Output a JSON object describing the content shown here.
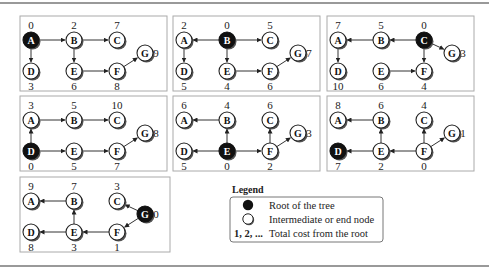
{
  "figure": {
    "panels": [
      {
        "root": "A",
        "nodes": {
          "A": {
            "cost": "0",
            "pos": "tl"
          },
          "B": {
            "cost": "2",
            "pos": "tm"
          },
          "C": {
            "cost": "7",
            "pos": "tr"
          },
          "D": {
            "cost": "3",
            "pos": "bl"
          },
          "E": {
            "cost": "6",
            "pos": "bm"
          },
          "F": {
            "cost": "8",
            "pos": "br"
          },
          "G": {
            "cost": "9",
            "pos": "g"
          }
        },
        "filled": [
          "A"
        ],
        "edges": [
          [
            "A",
            "B"
          ],
          [
            "B",
            "C"
          ],
          [
            "A",
            "D"
          ],
          [
            "B",
            "E"
          ],
          [
            "E",
            "F"
          ],
          [
            "F",
            "G"
          ]
        ]
      },
      {
        "root": "B",
        "nodes": {
          "A": {
            "cost": "2"
          },
          "B": {
            "cost": "0"
          },
          "C": {
            "cost": "5"
          },
          "D": {
            "cost": "5"
          },
          "E": {
            "cost": "4"
          },
          "F": {
            "cost": "6"
          },
          "G": {
            "cost": "7"
          }
        },
        "filled": [
          "B"
        ],
        "edges": [
          [
            "B",
            "A"
          ],
          [
            "B",
            "C"
          ],
          [
            "A",
            "D"
          ],
          [
            "B",
            "E"
          ],
          [
            "E",
            "F"
          ],
          [
            "F",
            "G"
          ]
        ]
      },
      {
        "root": "C",
        "nodes": {
          "A": {
            "cost": "7"
          },
          "B": {
            "cost": "5"
          },
          "C": {
            "cost": "0"
          },
          "D": {
            "cost": "10"
          },
          "E": {
            "cost": "6"
          },
          "F": {
            "cost": "4"
          },
          "G": {
            "cost": "3"
          }
        },
        "filled": [
          "C"
        ],
        "edges": [
          [
            "C",
            "B"
          ],
          [
            "B",
            "A"
          ],
          [
            "A",
            "D"
          ],
          [
            "C",
            "F"
          ],
          [
            "E",
            "F"
          ],
          [
            "C",
            "G"
          ]
        ]
      },
      {
        "root": "D",
        "nodes": {
          "A": {
            "cost": "3"
          },
          "B": {
            "cost": "5"
          },
          "C": {
            "cost": "10"
          },
          "D": {
            "cost": "0"
          },
          "E": {
            "cost": "5"
          },
          "F": {
            "cost": "7"
          },
          "G": {
            "cost": "8"
          }
        },
        "filled": [
          "D"
        ],
        "edges": [
          [
            "A",
            "B"
          ],
          [
            "B",
            "C"
          ],
          [
            "D",
            "A"
          ],
          [
            "D",
            "E"
          ],
          [
            "E",
            "F"
          ],
          [
            "F",
            "G"
          ]
        ]
      },
      {
        "root": "E",
        "nodes": {
          "A": {
            "cost": "6"
          },
          "B": {
            "cost": "4"
          },
          "C": {
            "cost": "6"
          },
          "D": {
            "cost": "5"
          },
          "E": {
            "cost": "0"
          },
          "F": {
            "cost": "2"
          },
          "G": {
            "cost": "3"
          }
        },
        "filled": [
          "E"
        ],
        "edges": [
          [
            "B",
            "A"
          ],
          [
            "E",
            "B"
          ],
          [
            "E",
            "D"
          ],
          [
            "E",
            "F"
          ],
          [
            "F",
            "C"
          ],
          [
            "F",
            "G"
          ]
        ]
      },
      {
        "root": "F",
        "nodes": {
          "A": {
            "cost": "8"
          },
          "B": {
            "cost": "6"
          },
          "C": {
            "cost": "4"
          },
          "D": {
            "cost": "7"
          },
          "E": {
            "cost": "2"
          },
          "F": {
            "cost": "0"
          },
          "G": {
            "cost": "1"
          }
        },
        "filled": [
          "D"
        ],
        "edges": [
          [
            "B",
            "A"
          ],
          [
            "E",
            "B"
          ],
          [
            "E",
            "D"
          ],
          [
            "F",
            "E"
          ],
          [
            "F",
            "C"
          ],
          [
            "F",
            "G"
          ]
        ]
      },
      {
        "root": "G",
        "nodes": {
          "A": {
            "cost": "9"
          },
          "B": {
            "cost": "7"
          },
          "C": {
            "cost": "3"
          },
          "D": {
            "cost": "8"
          },
          "E": {
            "cost": "3"
          },
          "F": {
            "cost": "1"
          },
          "G": {
            "cost": "0"
          }
        },
        "filled": [
          "G"
        ],
        "edges": [
          [
            "B",
            "A"
          ],
          [
            "E",
            "B"
          ],
          [
            "E",
            "D"
          ],
          [
            "F",
            "E"
          ],
          [
            "G",
            "C"
          ],
          [
            "G",
            "F"
          ]
        ]
      }
    ]
  },
  "legend": {
    "title": "Legend",
    "items": [
      {
        "symbol": "filled-circle",
        "label": "Root of the tree"
      },
      {
        "symbol": "open-circle",
        "label": "Intermediate or end node"
      },
      {
        "symbol": "1, 2, ...",
        "label": "Total cost from the root"
      }
    ]
  },
  "colors": {
    "root_fill": "#111111",
    "node_fill": "#ffffff",
    "panel_border": "#aaaaaa",
    "frame_line": "#777777"
  }
}
